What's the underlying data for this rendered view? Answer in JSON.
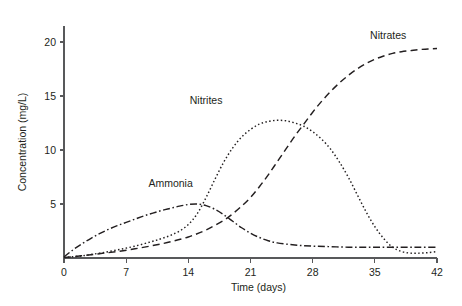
{
  "chart_data": {
    "type": "line",
    "title": "",
    "xlabel": "Time (days)",
    "ylabel": "Concentration (mg/L)",
    "xlim": [
      0,
      42
    ],
    "ylim": [
      0,
      21
    ],
    "xticks": [
      0,
      7,
      14,
      21,
      28,
      35,
      42
    ],
    "xtick_labels": [
      "0",
      "7",
      "14",
      "21",
      "28",
      "35",
      "42"
    ],
    "yticks": [
      5,
      10,
      15,
      20
    ],
    "ytick_labels": [
      "5",
      "10",
      "15",
      "20"
    ],
    "grid": false,
    "legend": "inline-annotations",
    "series": [
      {
        "name": "Ammonia",
        "label": "Ammonia",
        "linestyle": "dash-dot",
        "color": "#231f20",
        "label_x": 12.0,
        "label_y": 6.6,
        "x": [
          0,
          1,
          2,
          3,
          4,
          5,
          6,
          7,
          8,
          9,
          10,
          11,
          12,
          13,
          14,
          15,
          16,
          17,
          18,
          19,
          20,
          21,
          22,
          23,
          24,
          26,
          28,
          30,
          32,
          34,
          36,
          38,
          40,
          42
        ],
        "y": [
          0.1,
          0.75,
          1.3,
          1.8,
          2.25,
          2.65,
          3.0,
          3.3,
          3.6,
          3.9,
          4.15,
          4.4,
          4.6,
          4.8,
          4.95,
          5.0,
          4.85,
          4.5,
          4.0,
          3.4,
          2.8,
          2.3,
          1.9,
          1.6,
          1.4,
          1.2,
          1.1,
          1.05,
          1.0,
          1.0,
          1.0,
          1.0,
          1.0,
          1.0
        ]
      },
      {
        "name": "Nitrites",
        "label": "Nitrites",
        "linestyle": "dotted",
        "color": "#231f20",
        "label_x": 16.0,
        "label_y": 14.3,
        "x": [
          0,
          2,
          4,
          6,
          8,
          10,
          11,
          12,
          13,
          14,
          15,
          16,
          17,
          18,
          19,
          20,
          21,
          22,
          23,
          24,
          25,
          26,
          27,
          28,
          29,
          30,
          31,
          32,
          33,
          34,
          35,
          36,
          37,
          38,
          39,
          40,
          41,
          42
        ],
        "y": [
          0.05,
          0.2,
          0.45,
          0.75,
          1.1,
          1.55,
          1.8,
          2.1,
          2.5,
          3.1,
          4.1,
          5.6,
          7.3,
          8.9,
          10.2,
          11.2,
          11.9,
          12.4,
          12.65,
          12.75,
          12.7,
          12.5,
          12.2,
          11.7,
          11.0,
          10.1,
          8.9,
          7.5,
          5.9,
          4.3,
          2.9,
          1.8,
          1.0,
          0.6,
          0.45,
          0.45,
          0.5,
          0.6
        ]
      },
      {
        "name": "Nitrates",
        "label": "Nitrates",
        "linestyle": "dashed",
        "color": "#231f20",
        "label_x": 36.5,
        "label_y": 20.3,
        "x": [
          0,
          2,
          4,
          6,
          8,
          10,
          12,
          14,
          16,
          18,
          19,
          20,
          21,
          22,
          23,
          24,
          25,
          26,
          27,
          28,
          29,
          30,
          31,
          32,
          33,
          34,
          35,
          36,
          37,
          38,
          39,
          40,
          41,
          42
        ],
        "y": [
          0.05,
          0.2,
          0.4,
          0.6,
          0.85,
          1.15,
          1.5,
          1.95,
          2.6,
          3.5,
          4.1,
          4.8,
          5.6,
          6.6,
          7.7,
          8.9,
          10.1,
          11.3,
          12.4,
          13.5,
          14.5,
          15.4,
          16.2,
          16.9,
          17.5,
          18.0,
          18.4,
          18.7,
          18.95,
          19.1,
          19.2,
          19.3,
          19.35,
          19.4
        ]
      }
    ]
  }
}
